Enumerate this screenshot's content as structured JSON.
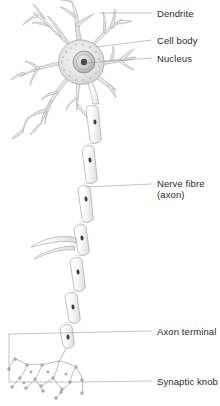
{
  "diagram": {
    "style": "pencil sketch, grayscale",
    "background_color": "#ffffff",
    "ink_color": "#9a9a9a",
    "dark_accent_color": "#3c3c3c",
    "text_color": "#2b2b2b"
  },
  "labels": [
    {
      "id": "dendrite",
      "text": "Dendrite",
      "x": 157,
      "y": 8,
      "leader": {
        "x1": 99,
        "y1": 13,
        "x2": 152,
        "y2": 13
      }
    },
    {
      "id": "cell-body",
      "text": "Cell body",
      "x": 157,
      "y": 40,
      "leader": {
        "x1": 96,
        "y1": 47,
        "x2": 152,
        "y2": 40
      }
    },
    {
      "id": "nucleus",
      "text": "Nucleus",
      "x": 157,
      "y": 57,
      "leader": {
        "x1": 86,
        "y1": 63,
        "x2": 152,
        "y2": 58
      }
    },
    {
      "id": "nerve-fibre",
      "text": "Nerve fibre",
      "x": 157,
      "y": 180,
      "leader": {
        "x1": 86,
        "y1": 187,
        "x2": 152,
        "y2": 184
      }
    },
    {
      "id": "axon-sub",
      "text": "(axon)",
      "x": 157,
      "y": 191,
      "leader": null
    },
    {
      "id": "axon-terminal",
      "text": "Axon terminal",
      "x": 157,
      "y": 328,
      "leader": {
        "x1": 9,
        "y1": 334,
        "x2": 152,
        "y2": 331
      }
    },
    {
      "id": "synaptic-knob",
      "text": "Synaptic knob",
      "x": 157,
      "y": 378,
      "leader": {
        "x1": 74,
        "y1": 382,
        "x2": 152,
        "y2": 381
      }
    }
  ],
  "parts": {
    "soma": {
      "center_x": 80,
      "center_y": 62,
      "label": "cell body (soma)"
    },
    "nucleus": {
      "center_x": 84,
      "center_y": 62,
      "radius": 11,
      "label": "nucleus"
    },
    "nucleolus": {
      "center_x": 84,
      "center_y": 62,
      "radius": 3.2,
      "label": "nucleolus"
    },
    "dendrite_count": 7,
    "myelin_segment_count": 9,
    "collateral_branch_y": 243,
    "terminal_knob_count": 22
  },
  "bracket": {
    "left_x": 9,
    "top_y": 334,
    "bottom_y": 382,
    "label": "axon terminal region bracket"
  }
}
